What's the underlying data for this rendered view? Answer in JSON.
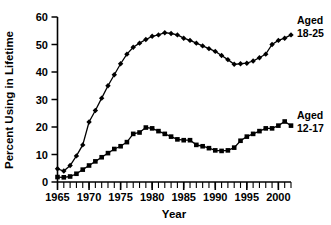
{
  "chart_data": {
    "type": "line",
    "title": "",
    "subtitle": "",
    "xlabel": "Year",
    "ylabel": "Percent Using in Lifetime",
    "xlim": [
      1965,
      2002
    ],
    "ylim": [
      0,
      60
    ],
    "grid": false,
    "legend_position": "right-inline-annotations",
    "yticks": [
      0,
      10,
      20,
      30,
      40,
      50,
      60
    ],
    "ytick_labels": [
      "0",
      "10",
      "20",
      "30",
      "40",
      "50",
      "60"
    ],
    "xticks": [
      1965,
      1970,
      1975,
      1980,
      1985,
      1990,
      1995,
      2000
    ],
    "xtick_labels": [
      "1965",
      "1970",
      "1975",
      "1980",
      "1985",
      "1990",
      "1995",
      "2000"
    ],
    "xtick_minor_step": 1,
    "marker": "diamond-and-square",
    "line_color": "#000000",
    "x": [
      1965,
      1966,
      1967,
      1968,
      1969,
      1970,
      1971,
      1972,
      1973,
      1974,
      1975,
      1976,
      1977,
      1978,
      1979,
      1980,
      1981,
      1982,
      1983,
      1984,
      1985,
      1986,
      1987,
      1988,
      1989,
      1990,
      1991,
      1992,
      1993,
      1994,
      1995,
      1996,
      1997,
      1998,
      1999,
      2000,
      2001,
      2002
    ],
    "series": [
      {
        "name": "Aged 18-25",
        "label_line1": "Aged",
        "label_line2": "18-25",
        "marker": "diamond",
        "color": "#000000",
        "values": [
          4.8,
          4.0,
          6.0,
          9.5,
          13.5,
          21.8,
          26.0,
          30.5,
          35.0,
          39.0,
          43.0,
          46.5,
          49.0,
          50.5,
          51.8,
          53.0,
          53.5,
          54.3,
          54.0,
          53.5,
          52.3,
          51.5,
          50.5,
          49.5,
          48.5,
          47.5,
          46.0,
          44.5,
          42.8,
          43.0,
          43.2,
          44.0,
          45.2,
          46.5,
          50.0,
          51.5,
          52.3,
          53.5
        ]
      },
      {
        "name": "Aged 12-17",
        "label_line1": "Aged",
        "label_line2": "12-17",
        "marker": "square",
        "color": "#000000",
        "values": [
          1.8,
          1.7,
          2.0,
          3.0,
          4.5,
          6.0,
          7.5,
          9.0,
          10.5,
          12.0,
          13.0,
          14.5,
          17.5,
          18.0,
          19.8,
          19.5,
          18.5,
          17.5,
          16.5,
          15.5,
          15.2,
          15.2,
          13.5,
          13.0,
          12.3,
          11.5,
          11.3,
          11.5,
          12.5,
          15.0,
          16.5,
          17.5,
          18.5,
          19.5,
          19.5,
          20.5,
          22.0,
          20.5
        ]
      }
    ]
  }
}
